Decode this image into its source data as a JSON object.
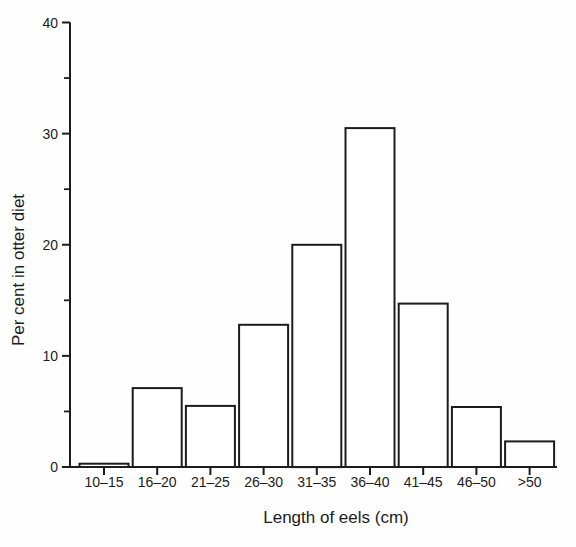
{
  "chart_data": {
    "type": "bar",
    "title": "",
    "categories": [
      "10–15",
      "16–20",
      "21–25",
      "26–30",
      "31–35",
      "36–40",
      "41–45",
      "46–50",
      ">50"
    ],
    "values": [
      0.3,
      7.1,
      5.5,
      12.8,
      20.0,
      30.5,
      14.7,
      5.4,
      2.3
    ],
    "xlabel": "Length of eels (cm)",
    "ylabel": "Per cent in otter diet",
    "ylim": [
      0,
      40
    ],
    "ytick_major": [
      0,
      10,
      20,
      30,
      40
    ],
    "ytick_minor": [
      5,
      15,
      25,
      35
    ],
    "grid": false,
    "legend": "none",
    "bar_fill": "#ffffff",
    "bar_stroke": "#1c1c1c",
    "axis_color": "#1c1c1c",
    "text_color": "#1c1c1c"
  }
}
